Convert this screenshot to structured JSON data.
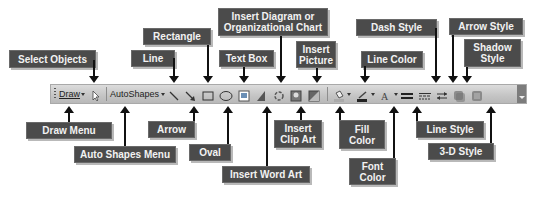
{
  "toolbar": {
    "draw_menu": "Draw",
    "autoshapes_menu": "AutoShapes",
    "icons": [
      "select-objects",
      "line",
      "arrow",
      "rectangle",
      "oval",
      "text-box",
      "insert-word-art",
      "insert-diagram",
      "insert-clip-art",
      "insert-picture",
      "fill-color",
      "line-color",
      "font-color",
      "line-style",
      "dash-style",
      "arrow-style",
      "shadow-style",
      "3d-style"
    ]
  },
  "labels": {
    "select_objects": "Select Objects",
    "line": "Line",
    "rectangle": "Rectangle",
    "text_box": "Text Box",
    "insert_diagram": "Insert Diagram or\nOrganizational Chart",
    "insert_picture": "Insert\nPicture",
    "line_color": "Line Color",
    "dash_style": "Dash Style",
    "arrow_style": "Arrow Style",
    "shadow_style": "Shadow\nStyle",
    "draw_menu": "Draw Menu",
    "auto_shapes_menu": "Auto Shapes Menu",
    "arrow": "Arrow",
    "oval": "Oval",
    "insert_word_art": "Insert Word Art",
    "insert_clip_art": "Insert\nClip Art",
    "fill_color": "Fill\nColor",
    "font_color": "Font\nColor",
    "line_style": "Line Style",
    "three_d_style": "3-D Style"
  },
  "colors": {
    "label_bg": "#4b4b4b",
    "label_text": "#f2f2f2",
    "toolbar_bg": "#c8c8c8"
  }
}
